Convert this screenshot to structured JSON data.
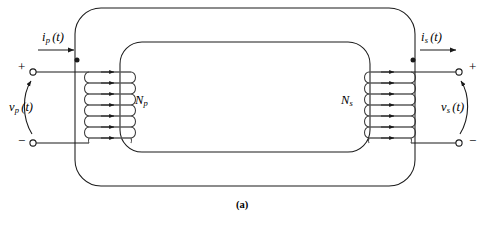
{
  "figure": {
    "caption": "(a)"
  },
  "primary": {
    "current_label": {
      "symbol": "i",
      "subscript": "p",
      "arg": "(t)"
    },
    "voltage_label": {
      "symbol": "v",
      "subscript": "p",
      "arg": "(t)"
    },
    "turns_label": {
      "symbol": "N",
      "subscript": "p"
    },
    "polarity_positive": "+",
    "polarity_negative": "−",
    "turns_count": 7,
    "dot_marker": "polarity-dot"
  },
  "secondary": {
    "current_label": {
      "symbol": "i",
      "subscript": "s",
      "arg": "(t)"
    },
    "voltage_label": {
      "symbol": "v",
      "subscript": "s",
      "arg": "(t)"
    },
    "turns_label": {
      "symbol": "N",
      "subscript": "s"
    },
    "polarity_positive": "+",
    "polarity_negative": "−",
    "turns_count": 7,
    "dot_marker": "polarity-dot"
  },
  "colors": {
    "line": "#1a1a1a",
    "wire": "#555555",
    "background": "#ffffff",
    "text": "#000000"
  },
  "geometry": {
    "core_outer": {
      "x": 75,
      "y": 8,
      "width": 340,
      "height": 178,
      "radius": 26
    },
    "core_inner": {
      "x": 120,
      "y": 42,
      "width": 250,
      "height": 110,
      "radius": 22
    },
    "primary_coil": {
      "x": 89,
      "y": 66,
      "turns": 7,
      "spacing": 11.5
    },
    "secondary_coil": {
      "x": 369,
      "y": 66,
      "turns": 7,
      "spacing": 11.5
    }
  }
}
